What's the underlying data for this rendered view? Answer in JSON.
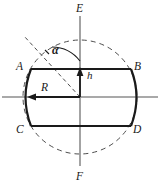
{
  "figure": {
    "kind": "geometry-diagram",
    "background_color": "#ffffff",
    "stroke_color": "#1a1a1a",
    "axis_color": "#808080",
    "dashed_color": "#555555",
    "center": {
      "x": 80,
      "y": 97
    },
    "circle_radius": 57,
    "labels": {
      "a": "A",
      "b": "B",
      "c": "C",
      "d": "D",
      "e": "E",
      "f": "F",
      "alpha": "α",
      "h": "h",
      "r": "R"
    },
    "label_positions": {
      "a": {
        "x": 16,
        "y": 62
      },
      "b": {
        "x": 134,
        "y": 62
      },
      "c": {
        "x": 16,
        "y": 126
      },
      "d": {
        "x": 133,
        "y": 126
      },
      "e": {
        "x": 76,
        "y": 4
      },
      "f": {
        "x": 76,
        "y": 172
      },
      "alpha": {
        "x": 48,
        "y": 45
      },
      "h": {
        "x": 86,
        "y": 72
      },
      "r": {
        "x": 41,
        "y": 83
      }
    },
    "shape_points": {
      "A": {
        "x": 31,
        "y": 69
      },
      "B": {
        "x": 131,
        "y": 69
      },
      "C": {
        "x": 31,
        "y": 126
      },
      "D": {
        "x": 131,
        "y": 126
      }
    },
    "vectors": {
      "h": {
        "from": {
          "x": 80,
          "y": 97
        },
        "to": {
          "x": 80,
          "y": 69
        },
        "label": "h"
      },
      "R": {
        "from": {
          "x": 80,
          "y": 97
        },
        "to": {
          "x": 28,
          "y": 97
        },
        "label": "R"
      }
    },
    "axis_vertical": {
      "x": 80,
      "y1": 16,
      "y2": 166,
      "label_top": "E",
      "label_bottom": "F"
    },
    "axis_horizontal": {
      "y": 97,
      "x1": 2,
      "x2": 158
    },
    "angle": {
      "symbol": "α",
      "vertex": {
        "x": 80,
        "y": 97
      },
      "arc_radius": 36
    }
  }
}
